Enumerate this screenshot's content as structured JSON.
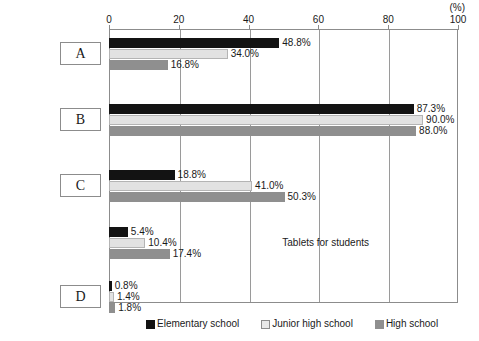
{
  "chart_data": {
    "type": "bar",
    "orientation": "horizontal",
    "title": "",
    "xlabel": "",
    "ylabel": "",
    "unit_label": "(%)",
    "xlim": [
      0,
      100
    ],
    "xticks": [
      0,
      20,
      40,
      60,
      80,
      100
    ],
    "xtick_labels": [
      "0",
      "20",
      "40",
      "60",
      "80",
      "100"
    ],
    "grid": true,
    "legend_position": "bottom",
    "categories": [
      "A",
      "B",
      "C",
      "Tablets for students",
      "D"
    ],
    "series": [
      {
        "name": "Elementary school",
        "color": "#131313",
        "values": [
          48.8,
          87.3,
          18.8,
          5.4,
          0.8
        ],
        "labels": [
          "48.8%",
          "87.3%",
          "18.8%",
          "5.4%",
          "0.8%"
        ]
      },
      {
        "name": "Junior high school",
        "color": "#e2e2e2",
        "values": [
          34.0,
          90.0,
          41.0,
          10.4,
          1.4
        ],
        "labels": [
          "34.0%",
          "90.0%",
          "41.0%",
          "10.4%",
          "1.4%"
        ]
      },
      {
        "name": "High school",
        "color": "#8f8f8f",
        "values": [
          16.8,
          88.0,
          50.3,
          17.4,
          1.8
        ],
        "labels": [
          "16.8%",
          "88.0%",
          "50.3%",
          "17.4%",
          "1.8%"
        ]
      }
    ]
  },
  "category_style": [
    "box",
    "box",
    "box",
    "text",
    "box"
  ]
}
